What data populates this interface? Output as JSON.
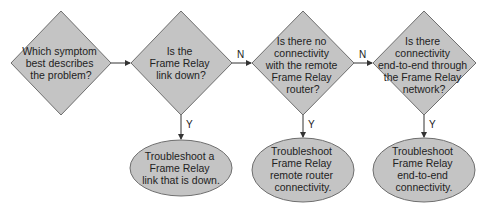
{
  "diagram": {
    "type": "flowchart",
    "colors": {
      "shape_fill": "#c4c4c4",
      "shape_stroke": "#6e6e6e",
      "edge": "#333333",
      "text": "#222222"
    },
    "decisions": [
      {
        "id": "d1",
        "lines": [
          "Which symptom",
          "best describes",
          "the problem?"
        ]
      },
      {
        "id": "d2",
        "lines": [
          "Is the",
          "Frame Relay",
          "link down?"
        ]
      },
      {
        "id": "d3",
        "lines": [
          "Is there no",
          "connectivity",
          "with the remote",
          "Frame Relay",
          "router?"
        ]
      },
      {
        "id": "d4",
        "lines": [
          "Is there",
          "connectivity",
          "end-to-end through",
          "the Frame Relay",
          "network?"
        ]
      }
    ],
    "actions": [
      {
        "id": "a1",
        "lines": [
          "Troubleshoot a",
          "Frame Relay",
          "link that is down."
        ]
      },
      {
        "id": "a2",
        "lines": [
          "Troubleshoot",
          "Frame Relay",
          "remote router",
          "connectivity."
        ]
      },
      {
        "id": "a3",
        "lines": [
          "Troubleshoot",
          "Frame Relay",
          "end-to-end",
          "connectivity."
        ]
      }
    ],
    "edges": [
      {
        "from": "d1",
        "to": "d2",
        "label": ""
      },
      {
        "from": "d2",
        "to": "d3",
        "label": "N"
      },
      {
        "from": "d3",
        "to": "d4",
        "label": "N"
      },
      {
        "from": "d2",
        "to": "a1",
        "label": "Y"
      },
      {
        "from": "d3",
        "to": "a2",
        "label": "Y"
      },
      {
        "from": "d4",
        "to": "a3",
        "label": "Y"
      }
    ]
  }
}
